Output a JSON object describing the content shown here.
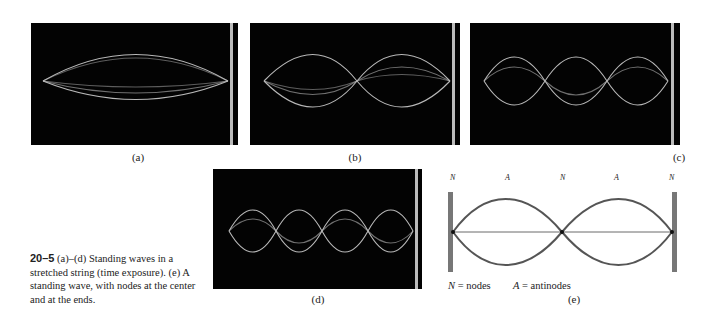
{
  "figure": {
    "number": "20–5",
    "caption_text": " (a)–(d) Standing waves in a stretched string (time exposure). (e) A standing wave, with nodes at the center and at the ends."
  },
  "panels": [
    {
      "label": "(a)",
      "loops": 1,
      "kind": "photo"
    },
    {
      "label": "(b)",
      "loops": 2,
      "kind": "photo"
    },
    {
      "label": "(c)",
      "loops": 3,
      "kind": "photo"
    },
    {
      "label": "(d)",
      "loops": 4,
      "kind": "photo"
    },
    {
      "label": "(e)",
      "loops": 2,
      "kind": "diagram"
    }
  ],
  "diagram_e": {
    "top_labels": [
      "N",
      "A",
      "N",
      "A",
      "N"
    ],
    "legend_nodes_sym": "N",
    "legend_nodes_text": " = nodes",
    "legend_antinodes_sym": "A",
    "legend_antinodes_text": " = antinodes"
  }
}
